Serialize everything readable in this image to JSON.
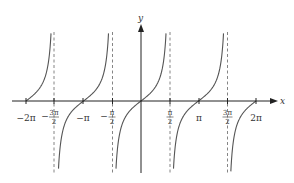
{
  "chart_data": {
    "type": "line",
    "title": "",
    "function": "y = tan(x)",
    "xlabel": "x",
    "ylabel": "y",
    "xlim": [
      -6.2832,
      6.2832
    ],
    "x_ticks": [
      {
        "value": -6.2832,
        "label": "−2π"
      },
      {
        "value": -4.7124,
        "label": "−3π/2",
        "num": "3π",
        "den": "2",
        "neg": true
      },
      {
        "value": -3.1416,
        "label": "−π"
      },
      {
        "value": -1.5708,
        "label": "−π/2",
        "num": "π",
        "den": "2",
        "neg": true
      },
      {
        "value": 1.5708,
        "label": "π/2",
        "num": "π",
        "den": "2",
        "neg": false
      },
      {
        "value": 3.1416,
        "label": "π"
      },
      {
        "value": 4.7124,
        "label": "3π/2",
        "num": "3π",
        "den": "2",
        "neg": false
      },
      {
        "value": 6.2832,
        "label": "2π"
      }
    ],
    "asymptotes": [
      -4.7124,
      -1.5708,
      1.5708,
      4.7124
    ],
    "asymptote_style": "dashed",
    "branches": [
      {
        "x_from": -6.2832,
        "x_to": -4.7124
      },
      {
        "x_from": -4.7124,
        "x_to": -1.5708
      },
      {
        "x_from": -1.5708,
        "x_to": 1.5708
      },
      {
        "x_from": 1.5708,
        "x_to": 4.7124
      },
      {
        "x_from": 4.7124,
        "x_to": 6.2832
      }
    ],
    "grid": false,
    "legend": null
  },
  "axes": {
    "x_label": "x",
    "y_label": "y"
  },
  "tick_labels": {
    "neg_2pi": "−2π",
    "neg_3pi_2_num": "3π",
    "neg_3pi_2_den": "2",
    "neg_sign": "−",
    "neg_pi": "−π",
    "neg_pi_2_num": "π",
    "neg_pi_2_den": "2",
    "pi_2_num": "π",
    "pi_2_den": "2",
    "pi": "π",
    "three_pi_2_num": "3π",
    "three_pi_2_den": "2",
    "two_pi": "2π"
  },
  "colors": {
    "curve": "#555555",
    "axis": "#222222",
    "asymptote": "#666666"
  }
}
